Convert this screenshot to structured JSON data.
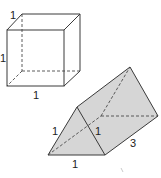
{
  "figure": {
    "cube": {
      "labels": {
        "depth": "1",
        "height": "1",
        "width": "1"
      }
    },
    "prism": {
      "fill_color": "#d6d6d6",
      "labels": {
        "side": "1",
        "inner": "1",
        "base": "1",
        "length": "3"
      }
    },
    "colors": {
      "line": "#3a3a3a",
      "background": "#ffffff"
    }
  }
}
